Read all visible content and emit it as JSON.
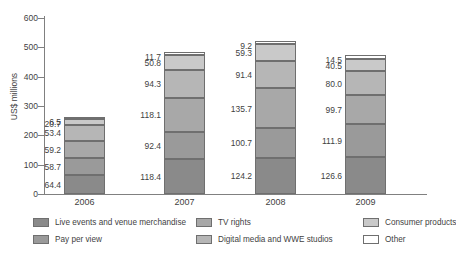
{
  "chart_data": {
    "type": "bar",
    "stacked": true,
    "title": "",
    "xlabel": "",
    "ylabel": "US$ millions",
    "ylim": [
      0,
      600
    ],
    "yticks": [
      0,
      100,
      200,
      300,
      400,
      500,
      600
    ],
    "ytick_labels": [
      "0",
      "100",
      "200",
      "300",
      "400",
      "500",
      "600"
    ],
    "grid": false,
    "legend_position": "bottom",
    "categories": [
      "2006",
      "2007",
      "2008",
      "2009"
    ],
    "series": [
      {
        "name": "Live events and venue merchandise",
        "color": "#8a8a8a",
        "values": [
          64.4,
          118.4,
          124.2,
          126.6
        ],
        "labels": [
          "64.4",
          "118.4",
          "124.2",
          "126.6"
        ]
      },
      {
        "name": "Pay per view",
        "color": "#9a9a9a",
        "values": [
          58.7,
          92.4,
          100.7,
          111.9
        ],
        "labels": [
          "58.7",
          "92.4",
          "100.7",
          "111.9"
        ]
      },
      {
        "name": "TV rights",
        "color": "#a8a8a8",
        "values": [
          59.2,
          118.1,
          135.7,
          99.7
        ],
        "labels": [
          "59.2",
          "118.1",
          "135.7",
          "99.7"
        ]
      },
      {
        "name": "Digital media and WWE studios",
        "color": "#b6b6b6",
        "values": [
          53.4,
          94.3,
          91.4,
          80.0
        ],
        "labels": [
          "53.4",
          "94.3",
          "91.4",
          "80.0"
        ]
      },
      {
        "name": "Consumer products",
        "color": "#c9c9c9",
        "values": [
          20.7,
          50.8,
          59.3,
          40.5
        ],
        "labels": [
          "20.7",
          "50.8",
          "59.3",
          "40.5"
        ]
      },
      {
        "name": "Other",
        "color": "#ffffff",
        "values": [
          6.5,
          11.7,
          9.2,
          14.5
        ],
        "labels": [
          "6.5",
          "11.7",
          "9.2",
          "14.5"
        ]
      }
    ],
    "totals": [
      262.9,
      485.7,
      520.5,
      473.2
    ]
  },
  "legend": {
    "items": [
      {
        "label": "Live events and venue merchandise",
        "color": "#8a8a8a"
      },
      {
        "label": "TV rights",
        "color": "#a8a8a8"
      },
      {
        "label": "Consumer products",
        "color": "#c9c9c9"
      },
      {
        "label": "Pay per view",
        "color": "#9a9a9a"
      },
      {
        "label": "Digital media and WWE studios",
        "color": "#b6b6b6"
      },
      {
        "label": "Other",
        "color": "#ffffff"
      }
    ]
  }
}
